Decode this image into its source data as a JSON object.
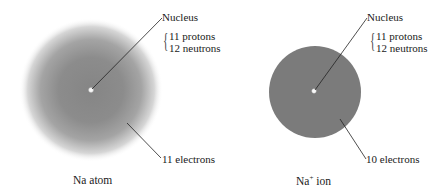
{
  "figure": {
    "atom": {
      "caption": "Na atom",
      "nucleus_label": "Nucleus",
      "composition": [
        "11 protons",
        "12 neutrons"
      ],
      "electron_label": "11 electrons",
      "cloud_style": "diffuse gradient",
      "colors": {
        "cloud_center": "#858585",
        "cloud_edge": "#ffffff",
        "nucleus": "#f5f5f5"
      }
    },
    "ion": {
      "caption_base": "Na",
      "caption_sup": "+",
      "caption_suffix": " ion",
      "nucleus_label": "Nucleus",
      "composition": [
        "11 protons",
        "12 neutrons"
      ],
      "electron_label": "10 electrons",
      "cloud_style": "solid sphere",
      "colors": {
        "cloud": "#7b7b7b",
        "nucleus": "#f5f5f5"
      }
    }
  }
}
